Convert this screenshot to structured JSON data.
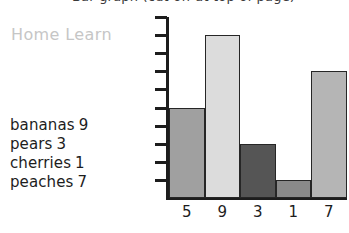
{
  "title": {
    "text": "Bar graph (cut off at top of page)",
    "visible_fragment": "descenders only"
  },
  "watermark": {
    "label": "Home Learn",
    "color": "#c6c6c6"
  },
  "legend": {
    "items": [
      {
        "name": "bananas",
        "count": "9"
      },
      {
        "name": "pears",
        "count": "3"
      },
      {
        "name": "cherries",
        "count": "1"
      },
      {
        "name": "peaches",
        "count": "7"
      }
    ]
  },
  "chart_data": {
    "type": "bar",
    "title": "",
    "xlabel": "",
    "ylabel": "",
    "categories": [
      "5",
      "9",
      "3",
      "1",
      "7"
    ],
    "values": [
      5,
      9,
      3,
      1,
      7
    ],
    "ylim": [
      0,
      10
    ],
    "ytick_count": 10,
    "ytick_values": [
      1,
      2,
      3,
      4,
      5,
      6,
      7,
      8,
      9,
      10
    ],
    "grid": false,
    "legend_position": "none",
    "bar_colors": [
      "#a0a0a0",
      "#dcdcdc",
      "#555555",
      "#8a8a8a",
      "#b5b5b5"
    ],
    "bar_border_color": "#262626",
    "axis_color": "#1d1d1d",
    "annotations": [
      "bananas 9",
      "pears 3",
      "cherries 1",
      "peaches 7"
    ]
  }
}
